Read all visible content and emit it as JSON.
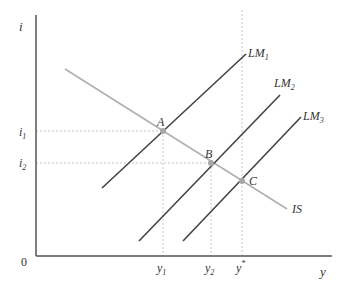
{
  "diagram": {
    "axes": {
      "y_label": "i",
      "x_label": "y",
      "origin_label": "0"
    },
    "y_ticks": [
      {
        "label": "i",
        "sub": "1",
        "y": 131
      },
      {
        "label": "i",
        "sub": "2",
        "y": 163
      }
    ],
    "x_ticks": [
      {
        "label": "y",
        "sub": "1",
        "x": 163
      },
      {
        "label": "y",
        "sub": "2",
        "x": 211
      },
      {
        "label": "y",
        "sup": "*",
        "x": 241
      }
    ],
    "curves": [
      {
        "name": "IS",
        "label": "IS",
        "color": "#b0b0b0"
      },
      {
        "name": "LM1",
        "label": "LM",
        "sub": "1",
        "color": "#444444"
      },
      {
        "name": "LM2",
        "label": "LM",
        "sub": "2",
        "color": "#444444"
      },
      {
        "name": "LM3",
        "label": "LM",
        "sub": "3",
        "color": "#444444"
      }
    ],
    "points": [
      {
        "label": "A",
        "x": 163,
        "y": 131
      },
      {
        "label": "B",
        "x": 211,
        "y": 163
      },
      {
        "label": "C",
        "x": 241,
        "y": 181
      }
    ]
  }
}
